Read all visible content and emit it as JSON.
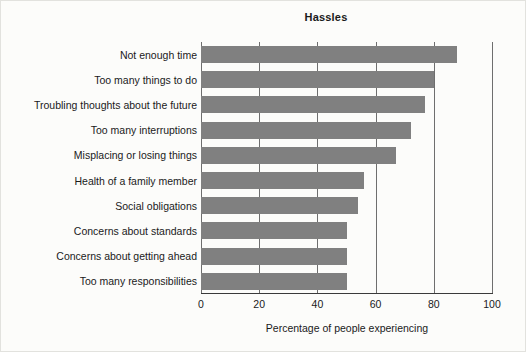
{
  "chart_data": {
    "type": "bar",
    "orientation": "horizontal",
    "title": "Hassles",
    "xlabel": "Percentage of people experiencing",
    "ylabel": "",
    "xlim": [
      0,
      100
    ],
    "xticks": [
      "0",
      "20",
      "40",
      "60",
      "80",
      "100"
    ],
    "xtick_values": [
      0,
      20,
      40,
      60,
      80,
      100
    ],
    "grid": "vertical",
    "legend": null,
    "bar_color": "#808080",
    "categories": [
      "Not enough time",
      "Too many things to do",
      "Troubling thoughts about the future",
      "Too many interruptions",
      "Misplacing or losing things",
      "Health of a family member",
      "Social obligations",
      "Concerns about standards",
      "Concerns about getting ahead",
      "Too many responsibilities"
    ],
    "values": [
      88,
      80,
      77,
      72,
      67,
      56,
      54,
      50,
      50,
      50
    ]
  }
}
